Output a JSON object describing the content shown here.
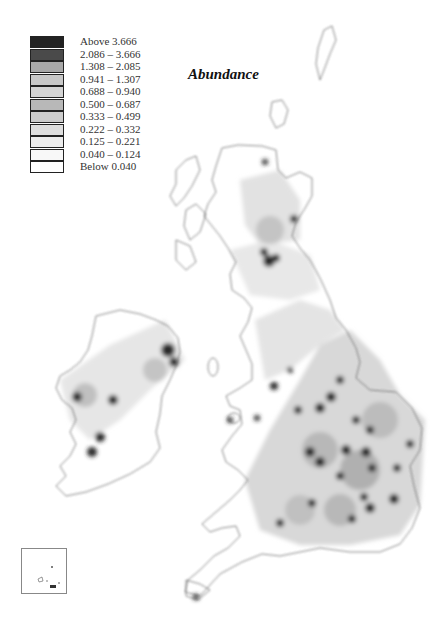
{
  "title": "Abundance",
  "legend": {
    "items": [
      {
        "label": "Above 3.666",
        "color": "#222222"
      },
      {
        "label": "2.086 – 3.666",
        "color": "#4a4a4a"
      },
      {
        "label": "1.308 – 2.085",
        "color": "#a8a8a8"
      },
      {
        "label": "0.941 – 1.307",
        "color": "#c8c8c8"
      },
      {
        "label": "0.688 – 0.940",
        "color": "#d4d4d4"
      },
      {
        "label": "0.500 – 0.687",
        "color": "#b8b8b8"
      },
      {
        "label": "0.333 – 0.499",
        "color": "#cccccc"
      },
      {
        "label": "0.222 – 0.332",
        "color": "#dedede"
      },
      {
        "label": "0.125 – 0.221",
        "color": "#ececec"
      },
      {
        "label": "0.040 – 0.124",
        "color": "#f8f8f8"
      },
      {
        "label": "Below 0.040",
        "color": "#ffffff"
      }
    ]
  },
  "map": {
    "region": "Britain and Ireland",
    "inset": "Channel Islands"
  }
}
